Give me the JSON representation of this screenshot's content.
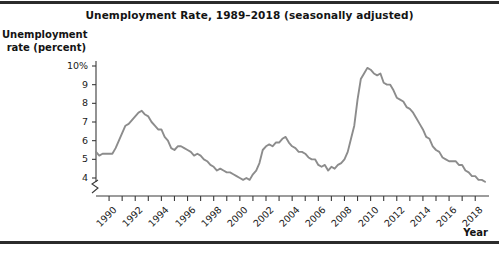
{
  "figure": {
    "title": "Unemployment Rate, 1989–2018 (seasonally adjusted)",
    "y_axis_title_line1": "Unemployment",
    "y_axis_title_line2": "rate (percent)",
    "x_axis_title": "Year",
    "line_color": "#8c8c8c",
    "axis_color": "#3a3a3a",
    "rule_color": "#2b2b2b",
    "background": "#ffffff"
  },
  "chart_data": {
    "type": "line",
    "title": "Unemployment Rate, 1989–2018 (seasonally adjusted)",
    "xlabel": "Year",
    "ylabel": "Unemployment rate (percent)",
    "xlim": [
      1989.0,
      2018.9
    ],
    "ylim": [
      3.5,
      10.4
    ],
    "grid": false,
    "legend": null,
    "y_axis_break": true,
    "y_axis_break_note": "axis broken between 0 and 4 percent",
    "ytick_labels": [
      "10%",
      "9",
      "8",
      "7",
      "6",
      "5",
      "4"
    ],
    "ytick_values": [
      10,
      9,
      8,
      7,
      6,
      5,
      4
    ],
    "xtick_values": [
      1990,
      1991,
      1992,
      1993,
      1994,
      1995,
      1996,
      1997,
      1998,
      1999,
      2000,
      2001,
      2002,
      2003,
      2004,
      2005,
      2006,
      2007,
      2008,
      2009,
      2010,
      2011,
      2012,
      2013,
      2014,
      2015,
      2016,
      2017,
      2018
    ],
    "xtick_labels_shown": [
      1990,
      1992,
      1994,
      1996,
      1998,
      2000,
      2002,
      2004,
      2006,
      2008,
      2010,
      2012,
      2014,
      2016,
      2018
    ],
    "series": [
      {
        "name": "Unemployment rate",
        "color": "#8c8c8c",
        "x": [
          1989.0,
          1989.25,
          1989.5,
          1989.75,
          1990.0,
          1990.25,
          1990.5,
          1990.75,
          1991.0,
          1991.25,
          1991.5,
          1991.75,
          1992.0,
          1992.25,
          1992.5,
          1992.75,
          1993.0,
          1993.25,
          1993.5,
          1993.75,
          1994.0,
          1994.25,
          1994.5,
          1994.75,
          1995.0,
          1995.25,
          1995.5,
          1995.75,
          1996.0,
          1996.25,
          1996.5,
          1996.75,
          1997.0,
          1997.25,
          1997.5,
          1997.75,
          1998.0,
          1998.25,
          1998.5,
          1998.75,
          1999.0,
          1999.25,
          1999.5,
          1999.75,
          2000.0,
          2000.25,
          2000.5,
          2000.75,
          2001.0,
          2001.25,
          2001.5,
          2001.75,
          2002.0,
          2002.25,
          2002.5,
          2002.75,
          2003.0,
          2003.25,
          2003.5,
          2003.75,
          2004.0,
          2004.25,
          2004.5,
          2004.75,
          2005.0,
          2005.25,
          2005.5,
          2005.75,
          2006.0,
          2006.25,
          2006.5,
          2006.75,
          2007.0,
          2007.25,
          2007.5,
          2007.75,
          2008.0,
          2008.25,
          2008.5,
          2008.75,
          2009.0,
          2009.25,
          2009.5,
          2009.75,
          2010.0,
          2010.25,
          2010.5,
          2010.75,
          2011.0,
          2011.25,
          2011.5,
          2011.75,
          2012.0,
          2012.25,
          2012.5,
          2012.75,
          2013.0,
          2013.25,
          2013.5,
          2013.75,
          2014.0,
          2014.25,
          2014.5,
          2014.75,
          2015.0,
          2015.25,
          2015.5,
          2015.75,
          2016.0,
          2016.25,
          2016.5,
          2016.75,
          2017.0,
          2017.25,
          2017.5,
          2017.75,
          2018.0,
          2018.25,
          2018.5,
          2018.75
        ],
        "y": [
          5.4,
          5.2,
          5.3,
          5.3,
          5.3,
          5.3,
          5.6,
          6.0,
          6.4,
          6.8,
          6.9,
          7.1,
          7.3,
          7.5,
          7.6,
          7.4,
          7.3,
          7.0,
          6.8,
          6.6,
          6.6,
          6.2,
          6.0,
          5.6,
          5.5,
          5.7,
          5.7,
          5.6,
          5.5,
          5.4,
          5.2,
          5.3,
          5.2,
          5.0,
          4.9,
          4.7,
          4.6,
          4.4,
          4.5,
          4.4,
          4.3,
          4.3,
          4.2,
          4.1,
          4.0,
          3.9,
          4.0,
          3.9,
          4.2,
          4.4,
          4.8,
          5.5,
          5.7,
          5.8,
          5.7,
          5.9,
          5.9,
          6.1,
          6.2,
          5.9,
          5.7,
          5.6,
          5.4,
          5.4,
          5.3,
          5.1,
          5.0,
          5.0,
          4.7,
          4.6,
          4.7,
          4.4,
          4.6,
          4.5,
          4.7,
          4.8,
          5.0,
          5.4,
          6.1,
          6.8,
          8.2,
          9.3,
          9.6,
          9.9,
          9.8,
          9.6,
          9.5,
          9.6,
          9.1,
          9.0,
          9.0,
          8.7,
          8.3,
          8.2,
          8.1,
          7.8,
          7.7,
          7.5,
          7.2,
          6.9,
          6.6,
          6.2,
          6.1,
          5.7,
          5.5,
          5.4,
          5.1,
          5.0,
          4.9,
          4.9,
          4.9,
          4.7,
          4.7,
          4.4,
          4.3,
          4.1,
          4.1,
          3.9,
          3.9,
          3.8
        ]
      }
    ]
  }
}
